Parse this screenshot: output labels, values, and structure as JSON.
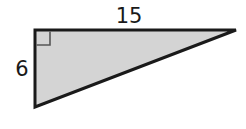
{
  "diagram": {
    "type": "right-triangle",
    "labels": {
      "top_side": "15",
      "left_side": "6"
    },
    "right_angle_marker": true,
    "colors": {
      "fill": "#d4d4d4",
      "stroke": "#1a1a1a",
      "marker": "#555555"
    }
  }
}
